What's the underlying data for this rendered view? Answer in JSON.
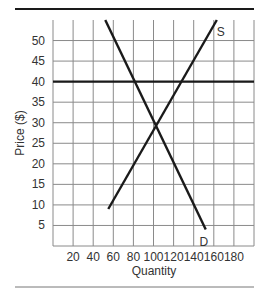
{
  "chart_data": {
    "type": "line",
    "title": "",
    "xlabel": "Quantity",
    "ylabel": "Price ($)",
    "xlim": [
      0,
      200
    ],
    "ylim": [
      0,
      55
    ],
    "x_ticks": [
      20,
      40,
      60,
      80,
      100,
      120,
      140,
      160,
      180
    ],
    "y_ticks": [
      5,
      10,
      15,
      20,
      25,
      30,
      35,
      40,
      45,
      50
    ],
    "grid": true,
    "legend": "none (curves labeled directly)",
    "series": [
      {
        "name": "S",
        "label": "S",
        "kind": "supply",
        "points": [
          [
            55,
            9
          ],
          [
            163,
            55
          ]
        ]
      },
      {
        "name": "D",
        "label": "D",
        "kind": "demand",
        "points": [
          [
            52,
            55
          ],
          [
            152,
            4
          ]
        ]
      },
      {
        "name": "Price line",
        "label": "",
        "kind": "horizontal",
        "points": [
          [
            0,
            40
          ],
          [
            200,
            40
          ]
        ]
      }
    ],
    "annotations": [
      {
        "text": "S",
        "x": 167,
        "y": 52
      },
      {
        "text": "D",
        "x": 150,
        "y": 1
      }
    ],
    "equilibrium": {
      "quantity": 100,
      "price": 30
    }
  },
  "colors": {
    "grid": "#8a8a8a",
    "curve": "#1a1a1a",
    "text": "#333333",
    "rule_top": "#1a1a1a",
    "rule_bottom": "#777777"
  }
}
